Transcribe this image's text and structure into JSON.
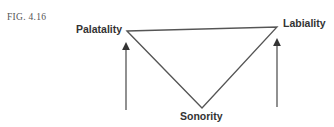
{
  "figure": {
    "label": "FIG. 4.16",
    "vertices": {
      "left": "Palatality",
      "right": "Labiality",
      "bottom": "Sonority"
    },
    "arrows": [
      {
        "name": "palatality-arrow",
        "direction": "up",
        "under": "Palatality"
      },
      {
        "name": "labiality-arrow",
        "direction": "up",
        "under": "Labiality"
      }
    ],
    "line_color": "#555555"
  }
}
